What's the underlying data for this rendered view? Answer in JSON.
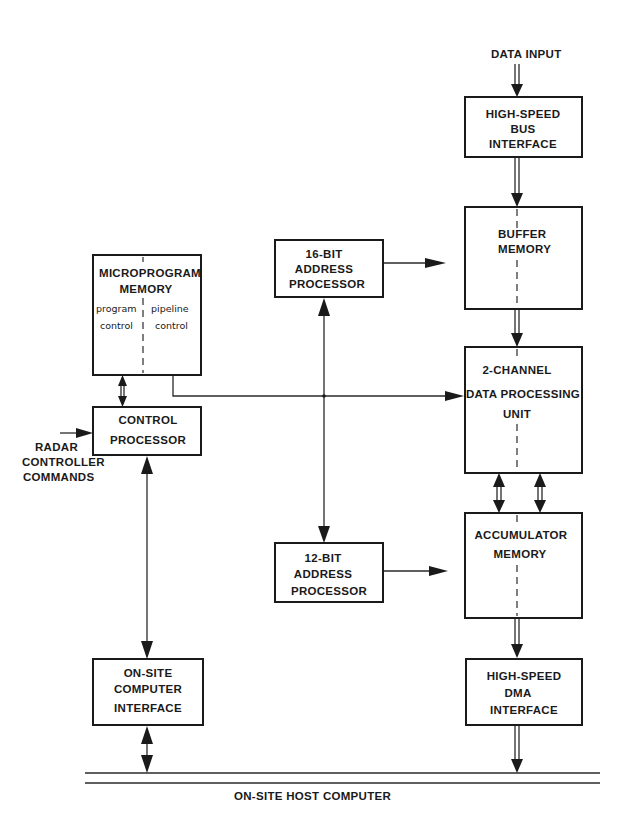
{
  "diagram": {
    "inputs": {
      "data_input": "DATA INPUT",
      "radar_commands": [
        "RADAR",
        "CONTROLLER",
        "COMMANDS"
      ]
    },
    "blocks": {
      "hs_bus": [
        "HIGH-SPEED",
        "BUS",
        "INTERFACE"
      ],
      "buffer": [
        "BUFFER",
        "MEMORY"
      ],
      "dpu": [
        "2-CHANNEL",
        "DATA PROCESSING",
        "UNIT"
      ],
      "accum": [
        "ACCUMULATOR",
        "MEMORY"
      ],
      "hs_dma": [
        "HIGH-SPEED",
        "DMA",
        "INTERFACE"
      ],
      "microprogram": [
        "MICROPROGRAM",
        "MEMORY"
      ],
      "microprogram_left": [
        "program",
        "control"
      ],
      "microprogram_right": [
        "pipeline",
        "control"
      ],
      "control": [
        "CONTROL",
        "PROCESSOR"
      ],
      "addr16": [
        "16-BIT",
        "ADDRESS",
        "PROCESSOR"
      ],
      "addr12": [
        "12-BIT",
        "ADDRESS",
        "PROCESSOR"
      ],
      "onsite_if": [
        "ON-SITE",
        "COMPUTER",
        "INTERFACE"
      ]
    },
    "bus_label": "ON-SITE HOST COMPUTER"
  }
}
